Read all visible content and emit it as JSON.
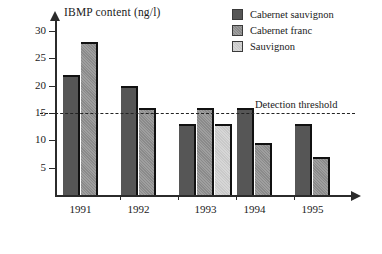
{
  "chart_data": {
    "type": "bar",
    "title": "IBMP content (ng/l)",
    "xlabel": "",
    "ylabel": "IBMP content (ng/l)",
    "categories": [
      "1991",
      "1992",
      "1993",
      "1994",
      "1995"
    ],
    "series": [
      {
        "name": "Cabernet sauvignon",
        "color": "#565656",
        "values": [
          22,
          20,
          13,
          16,
          13
        ]
      },
      {
        "name": "Cabernet franc",
        "color": "#8a8a8a",
        "values": [
          28,
          16,
          16,
          9.5,
          7
        ]
      },
      {
        "name": "Sauvignon",
        "color": "#c9c9c9",
        "values": [
          null,
          null,
          13,
          null,
          null
        ]
      }
    ],
    "ylim": [
      0,
      32
    ],
    "yticks": [
      5,
      10,
      15,
      20,
      25,
      30
    ],
    "grid": false,
    "legend_position": "top-right",
    "annotations": [
      {
        "name": "detection-threshold",
        "label": "Detection threshold",
        "value": 15,
        "style": "dashed"
      }
    ]
  },
  "legend": {
    "items": [
      {
        "label": "Cabernet sauvignon"
      },
      {
        "label": "Cabernet franc"
      },
      {
        "label": "Sauvignon"
      }
    ]
  },
  "axis": {
    "title": "IBMP content (ng/l)",
    "y_tick_labels": [
      "30",
      "25",
      "20",
      "15",
      "10",
      "5"
    ],
    "x_tick_labels": [
      "1991",
      "1992",
      "1993",
      "1994",
      "1995"
    ]
  },
  "threshold": {
    "label": "Detection threshold",
    "value": 15
  }
}
